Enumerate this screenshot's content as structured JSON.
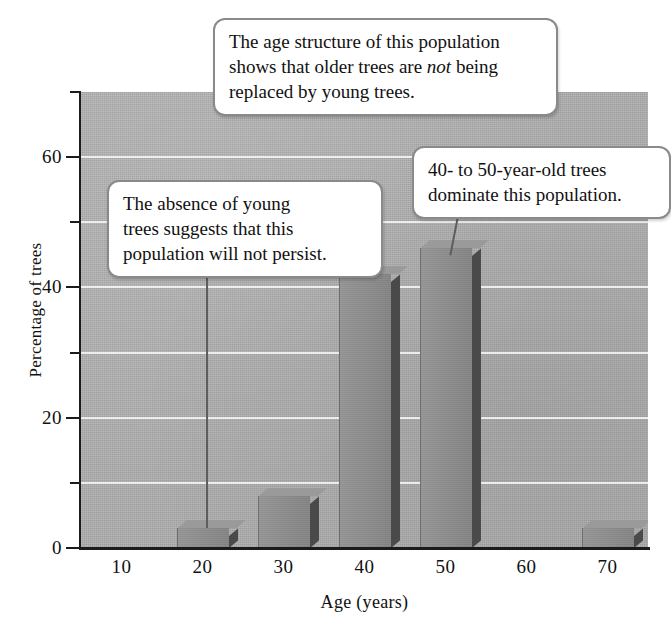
{
  "chart_data": {
    "type": "bar",
    "title": "",
    "xlabel": "Age (years)",
    "ylabel": "Percentage of trees",
    "categories": [
      "10",
      "20",
      "30",
      "40",
      "50",
      "60",
      "70"
    ],
    "values": [
      0,
      3,
      8,
      42,
      46,
      0,
      3
    ],
    "ylim": [
      0,
      70
    ],
    "yticks_major": [
      "0",
      "20",
      "40",
      "60"
    ],
    "yticks_major_values": [
      0,
      20,
      40,
      60
    ],
    "yticks_minor_values": [
      10,
      30,
      50,
      70
    ],
    "gridlines": [
      10,
      20,
      30,
      40,
      50,
      60
    ],
    "grid": true,
    "legend": "none",
    "bar_color": "#8e8e8e",
    "plot_background": "#b0b0b0",
    "gridline_color": "#f2f2f2",
    "axis_color": "#1b1b1b",
    "annotations": [
      {
        "id": "top-callout",
        "line1": "The age structure of this population",
        "line2_a": "shows that older trees are ",
        "line2_em": "not",
        "line2_b": " being",
        "line3": "replaced by young trees."
      },
      {
        "id": "left-callout",
        "line1": "The absence of young",
        "line2": "trees suggests that this",
        "line3": "population will not persist."
      },
      {
        "id": "right-callout",
        "line1": "40- to 50-year-old trees",
        "line2": "dominate this population."
      }
    ]
  }
}
